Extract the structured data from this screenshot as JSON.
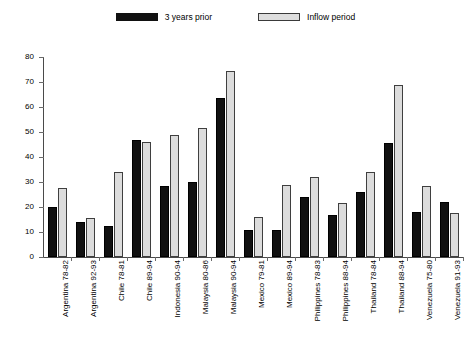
{
  "legend": {
    "entries": [
      {
        "label": "3 years prior",
        "key": "prior",
        "color": "#111111"
      },
      {
        "label": "Inflow period",
        "key": "inflow",
        "color": "#dcdcdc"
      }
    ]
  },
  "axis": {
    "y_ticks": [
      "80",
      "70",
      "60",
      "50",
      "40",
      "30",
      "20",
      "10",
      "0"
    ]
  },
  "chart_data": {
    "type": "bar",
    "title": "",
    "xlabel": "",
    "ylabel": "",
    "ylim": [
      0,
      80
    ],
    "y_tick_step": 10,
    "grid": false,
    "legend_position": "top-center",
    "orientation": "vertical",
    "grouped": true,
    "categories": [
      "Argentina 78-82",
      "Argentina 92-93",
      "Chile 78-81",
      "Chile 89-94",
      "Indonesia 90-94",
      "Malaysia 80-86",
      "Malaysia 90-94",
      "Mexico 79-81",
      "Mexico 89-94",
      "Philippines 78-83",
      "Philippines 88-94",
      "Thailand 78-84",
      "Thailand 88-94",
      "Venezuela 75-80",
      "Venezuela 91-93"
    ],
    "series": [
      {
        "name": "3 years prior",
        "color": "#111111",
        "values": [
          20,
          14,
          12.5,
          47,
          28.5,
          30,
          63.5,
          11,
          11,
          24,
          17,
          26,
          45.5,
          18,
          22
        ]
      },
      {
        "name": "Inflow period",
        "color": "#dcdcdc",
        "values": [
          27.5,
          15.5,
          34,
          46,
          49,
          51.5,
          74.5,
          16,
          29,
          32,
          21.5,
          34,
          69,
          28.5,
          17.5
        ]
      }
    ]
  }
}
